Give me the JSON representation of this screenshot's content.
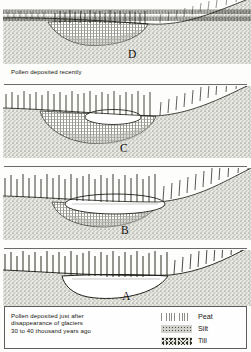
{
  "figure": {
    "title_text": "",
    "panel_order": [
      "D",
      "C",
      "B",
      "A"
    ]
  },
  "panels": [
    {
      "letter": "D",
      "caption": "Pollen deposited recently",
      "stage": "basin completely filled with peat; no open water",
      "water_present": false,
      "peat_present": true,
      "silt_present": true,
      "till_present": true
    },
    {
      "letter": "C",
      "caption": "",
      "stage": "small remaining pond above thick peat fill",
      "water_present": true,
      "peat_present": true,
      "silt_present": true,
      "till_present": true
    },
    {
      "letter": "B",
      "caption": "",
      "stage": "shallow lake with silt and peat accumulating on basin floor",
      "water_present": true,
      "peat_present": true,
      "silt_present": true,
      "till_present": true
    },
    {
      "letter": "A",
      "caption": "Pollen deposited just after\ndisappearance of glaciers\n30 to 40 thousand years ago",
      "stage": "open deep lake resting directly on till",
      "water_present": true,
      "peat_present": false,
      "silt_present": false,
      "till_present": true
    }
  ],
  "legend": {
    "items": [
      {
        "label": "Peat",
        "pattern": "fine-grid-hatch"
      },
      {
        "label": "Silt",
        "pattern": "dense-stipple"
      },
      {
        "label": "Till",
        "pattern": "coarse-speckle"
      }
    ]
  },
  "colors": {
    "ink": "#16160f",
    "water": "#ffffff",
    "paper": "#fdfdfb",
    "till": "#bdbdb6",
    "silt": "#9a9a93",
    "peat": "#c9c9c2"
  }
}
